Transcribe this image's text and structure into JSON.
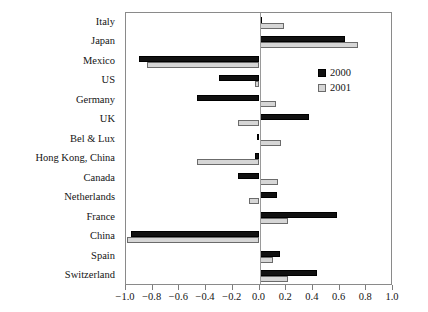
{
  "chart_data": {
    "type": "bar",
    "orientation": "horizontal",
    "title": "",
    "xlabel": "",
    "ylabel": "",
    "xlim": [
      -1.0,
      1.0
    ],
    "xticks": [
      -1.0,
      -0.8,
      -0.6,
      -0.4,
      -0.2,
      0.0,
      0.2,
      0.4,
      0.6,
      0.8,
      1.0
    ],
    "xtick_labels": [
      "−1.0",
      "−0.8",
      "−0.6",
      "−0.4",
      "−0.2",
      "0.0",
      "0.2",
      "0.4",
      "0.6",
      "0.8",
      "1.0"
    ],
    "grid": false,
    "zero_line": true,
    "legend_position": "upper right",
    "categories": [
      "Italy",
      "Japan",
      "Mexico",
      "US",
      "Germany",
      "UK",
      "Bel & Lux",
      "Hong Kong, China",
      "Canada",
      "Netherlands",
      "France",
      "China",
      "Spain",
      "Switzerland"
    ],
    "series": [
      {
        "name": "2000",
        "color": "#111111",
        "values": [
          0.02,
          0.64,
          -0.9,
          -0.3,
          -0.47,
          0.37,
          -0.02,
          -0.03,
          -0.16,
          0.13,
          0.58,
          -0.96,
          0.15,
          0.43
        ]
      },
      {
        "name": "2001",
        "color": "#d6d6d6",
        "values": [
          0.18,
          0.74,
          -0.84,
          -0.03,
          0.12,
          -0.16,
          0.16,
          -0.47,
          0.14,
          -0.08,
          0.21,
          -0.99,
          0.1,
          0.21
        ]
      }
    ]
  },
  "legend": {
    "entries": [
      {
        "label": "2000",
        "swatch": "black-square"
      },
      {
        "label": "2001",
        "swatch": "gray-square"
      }
    ]
  }
}
